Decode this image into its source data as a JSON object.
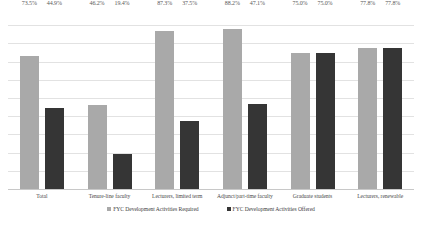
{
  "chart_data": {
    "type": "bar",
    "title": "",
    "subtitle": "",
    "xlabel": "",
    "ylabel": "",
    "ylim": [
      0,
      100
    ],
    "grid": true,
    "grid_lines": [
      10,
      20,
      30,
      40,
      50,
      60,
      70,
      80,
      90
    ],
    "legend_position": "bottom",
    "value_suffix": "%",
    "categories": [
      "Total",
      "Tenure-line faculty",
      "Lecturers, limited term",
      "Adjunct/part-time faculty",
      "Graduate students",
      "Lecturers, renewable"
    ],
    "series": [
      {
        "name": "FYC Development Activities Required",
        "color": "#a9a9a9",
        "values": [
          73.5,
          46.2,
          87.3,
          88.2,
          75.0,
          77.8
        ],
        "labels": [
          "73.5%",
          "46.2%",
          "87.3%",
          "88.2%",
          "75.0%",
          "77.8%"
        ]
      },
      {
        "name": "FYC Development Activities Offered",
        "color": "#353535",
        "values": [
          44.9,
          19.4,
          37.5,
          47.1,
          75.0,
          77.8
        ],
        "labels": [
          "44.9%",
          "19.4%",
          "37.5%",
          "47.1%",
          "75.0%",
          "77.8%"
        ]
      }
    ]
  },
  "legend": {
    "items": [
      {
        "label": "FYC Development Activities Required",
        "color": "#a9a9a9"
      },
      {
        "label": "FYC Development Activities Offered",
        "color": "#353535"
      }
    ]
  },
  "colors": {
    "series_required": "#a9a9a9",
    "series_offered": "#353535",
    "gridline": "#e2e2e2",
    "axis": "#c8c8c8",
    "label_text": "#5a5a5a",
    "background": "#ffffff"
  }
}
